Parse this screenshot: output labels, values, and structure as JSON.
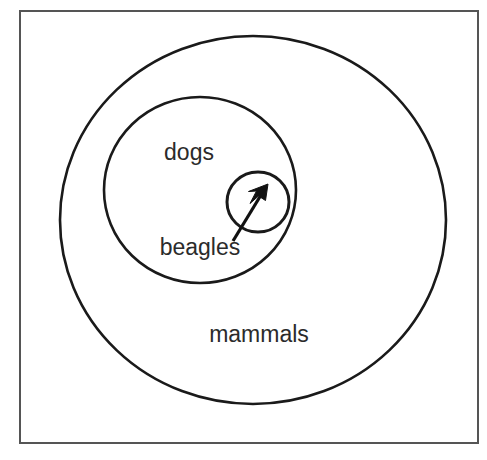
{
  "diagram": {
    "background_color": "#ffffff",
    "stroke_color": "#1a1a1a",
    "frame_color": "#555555",
    "label_color": "#2b2b2b",
    "sets": [
      {
        "id": "mammals",
        "label": "mammals",
        "level": 0,
        "cx": 253,
        "cy": 220,
        "rx": 193,
        "ry": 184,
        "stroke_width": 2.6,
        "label_x": 259,
        "label_y": 342
      },
      {
        "id": "dogs",
        "label": "dogs",
        "level": 1,
        "cx": 200,
        "cy": 190,
        "rx": 96,
        "ry": 93,
        "stroke_width": 2.6,
        "label_x": 189,
        "label_y": 160
      },
      {
        "id": "beagles",
        "label": "beagles",
        "level": 2,
        "cx": 258,
        "cy": 202,
        "rx": 31,
        "ry": 30,
        "stroke_width": 3.0,
        "label_x": 200,
        "label_y": 255
      }
    ],
    "pointer": {
      "name": "beagles-pointer-arrow",
      "tail_x": 233,
      "tail_y": 241,
      "tip_x": 268,
      "tip_y": 184,
      "color": "#111111"
    },
    "frame": {
      "x": 20,
      "y": 11,
      "width": 458,
      "height": 432
    }
  }
}
